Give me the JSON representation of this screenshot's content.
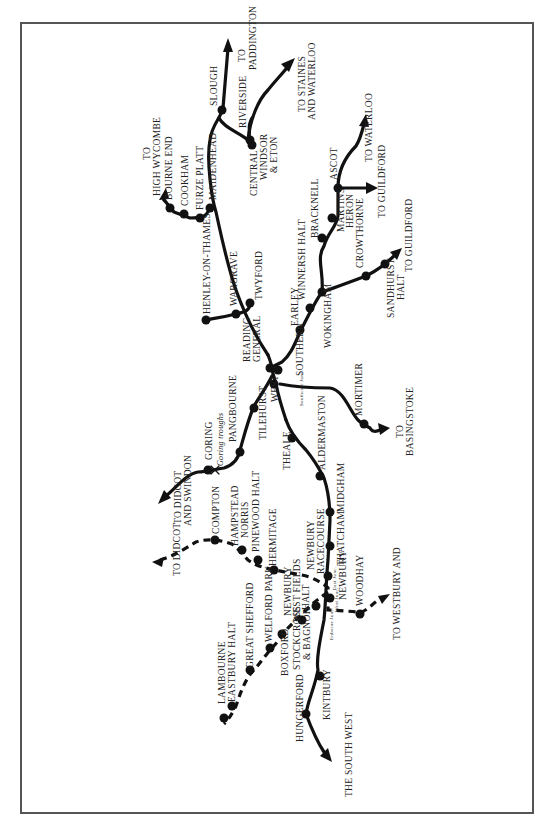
{
  "map": {
    "title": "Railways around Reading and Newbury",
    "orientation": "rotated -90deg",
    "colors": {
      "line": "#111111",
      "frame": "#555555",
      "background": "#ffffff"
    },
    "stations": [
      {
        "id": "slough",
        "label": "SLOUGH"
      },
      {
        "id": "riverside",
        "label": "RIVERSIDE"
      },
      {
        "id": "windsor_central",
        "label": "CENTRAL"
      },
      {
        "id": "windsor",
        "label": "WINDSOR"
      },
      {
        "id": "eton",
        "label": "& ETON"
      },
      {
        "id": "maidenhead",
        "label": "MAIDENHEAD"
      },
      {
        "id": "furze_platt",
        "label": "FURZE PLATT"
      },
      {
        "id": "cookham",
        "label": "COOKHAM"
      },
      {
        "id": "bourne_end",
        "label": "BOURNE END"
      },
      {
        "id": "twyford",
        "label": "TWYFORD"
      },
      {
        "id": "wargrave",
        "label": "WARGRAVE"
      },
      {
        "id": "henley",
        "label": "HENLEY-ON-THAMES"
      },
      {
        "id": "reading_general_1",
        "label": "READING"
      },
      {
        "id": "reading_general_2",
        "label": "GENERAL"
      },
      {
        "id": "reading_southern",
        "label": "SOUTHERN"
      },
      {
        "id": "reading_west",
        "label": "WEST"
      },
      {
        "id": "earley",
        "label": "EARLEY"
      },
      {
        "id": "winnersh",
        "label": "WINNERSH HALT"
      },
      {
        "id": "wokingham",
        "label": "WOKINGHAM"
      },
      {
        "id": "bracknell",
        "label": "BRACKNELL"
      },
      {
        "id": "martins_heron_1",
        "label": "MARTINS"
      },
      {
        "id": "martins_heron_2",
        "label": "HERON"
      },
      {
        "id": "ascot",
        "label": "ASCOT"
      },
      {
        "id": "crowthorne",
        "label": "CROWTHORNE"
      },
      {
        "id": "sandhurst_1",
        "label": "SANDHURST"
      },
      {
        "id": "sandhurst_2",
        "label": "HALT"
      },
      {
        "id": "tilehurst",
        "label": "TILEHURST"
      },
      {
        "id": "pangbourne",
        "label": "PANGBOURNE"
      },
      {
        "id": "goring",
        "label": "GORING"
      },
      {
        "id": "goring_troughs",
        "label": "Goring troughs"
      },
      {
        "id": "southcote",
        "label": "Southcote Junc."
      },
      {
        "id": "mortimer",
        "label": "MORTIMER"
      },
      {
        "id": "theale",
        "label": "THEALE"
      },
      {
        "id": "aldermaston",
        "label": "ALDERMASTON"
      },
      {
        "id": "midgham",
        "label": "MIDGHAM"
      },
      {
        "id": "thatcham",
        "label": "THATCHAM"
      },
      {
        "id": "racecourse_1",
        "label": "NEWBURY"
      },
      {
        "id": "racecourse_2",
        "label": "RACECOURSE"
      },
      {
        "id": "newbury",
        "label": "NEWBURY"
      },
      {
        "id": "east_junc",
        "label": "East Junc."
      },
      {
        "id": "west_junc",
        "label": "West Junc."
      },
      {
        "id": "enborne_junc",
        "label": "Enborne Junc."
      },
      {
        "id": "woodhay",
        "label": "WOODHAY"
      },
      {
        "id": "compton",
        "label": "COMPTON"
      },
      {
        "id": "hampstead_1",
        "label": "HAMPSTEAD"
      },
      {
        "id": "hampstead_2",
        "label": "NORRIS"
      },
      {
        "id": "pinewood",
        "label": "PINEWOOD HALT"
      },
      {
        "id": "hermitage",
        "label": "HERMITAGE"
      },
      {
        "id": "westfields_1",
        "label": "NEWBURY"
      },
      {
        "id": "westfields_2",
        "label": "WEST FIELDS"
      },
      {
        "id": "westfields_3",
        "label": "HALT"
      },
      {
        "id": "stockcross_1",
        "label": "STOCKCROSS"
      },
      {
        "id": "stockcross_2",
        "label": "& BAGNOR"
      },
      {
        "id": "boxford",
        "label": "BOXFORD"
      },
      {
        "id": "welford",
        "label": "WELFORD PARK"
      },
      {
        "id": "great_shefford",
        "label": "GREAT SHEFFORD"
      },
      {
        "id": "eastbury",
        "label": "EASTBURY HALT"
      },
      {
        "id": "lambourne",
        "label": "LAMBOURNE"
      },
      {
        "id": "kintbury",
        "label": "KINTBURY"
      },
      {
        "id": "hungerford",
        "label": "HUNGERFORD"
      }
    ],
    "destinations": [
      {
        "id": "paddington_1",
        "label": "TO"
      },
      {
        "id": "paddington_2",
        "label": "PADDINGTON"
      },
      {
        "id": "staines_1",
        "label": "TO STAINES"
      },
      {
        "id": "staines_2",
        "label": "AND WATERLOO"
      },
      {
        "id": "high_wycombe_1",
        "label": "TO"
      },
      {
        "id": "high_wycombe_2",
        "label": "HIGH WYCOMBE"
      },
      {
        "id": "waterloo",
        "label": "TO WATERLOO"
      },
      {
        "id": "guildford_1",
        "label": "TO GUILDFORD"
      },
      {
        "id": "guildford_2",
        "label": "TO GUILDFORD"
      },
      {
        "id": "basingstoke_1",
        "label": "TO"
      },
      {
        "id": "basingstoke_2",
        "label": "BASINGSTOKE"
      },
      {
        "id": "didcot_swindon_1",
        "label": "TO DIDCOT"
      },
      {
        "id": "didcot_swindon_2",
        "label": "AND SWINDON"
      },
      {
        "id": "didcot",
        "label": "TO DIDCOT"
      },
      {
        "id": "winchester",
        "label": "TO WINCHESTER"
      },
      {
        "id": "westbury_1",
        "label": "TO WESTBURY AND"
      },
      {
        "id": "westbury_2",
        "label": "THE SOUTH WEST"
      }
    ]
  }
}
